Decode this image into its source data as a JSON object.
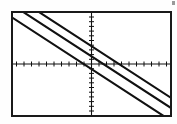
{
  "screen": {
    "title": "Graphing calculator plot window",
    "frame_color": "#1a1a1a",
    "background_color": "#ffffff",
    "ink_color": "#111111"
  },
  "artifact": {
    "name": "scan-artifact",
    "color": "#9a9a9a"
  },
  "chart_data": {
    "type": "line",
    "title": "",
    "subtitle": "",
    "xlabel": "",
    "ylabel": "",
    "grid": false,
    "legend": "none",
    "xlim": [
      -10,
      10
    ],
    "ylim": [
      -10,
      10
    ],
    "x_tick_step": 1,
    "y_tick_step": 1,
    "x_tick_count": 20,
    "y_tick_count": 20,
    "axis_style": "crosshair axes with unit tick marks, no numeric labels",
    "x_axis_y_value": 0,
    "y_axis_x_value": 0,
    "line_style": "solid dotted-pixel (calculator raster)",
    "series": [
      {
        "name": "line-1-upper",
        "slope": -1.0,
        "intercept": 3.5,
        "x": [
          -10,
          10
        ],
        "values": [
          13.5,
          -6.5
        ]
      },
      {
        "name": "line-2-middle",
        "slope": -1.0,
        "intercept": 1.5,
        "x": [
          -10,
          10
        ],
        "values": [
          11.5,
          -8.5
        ]
      },
      {
        "name": "line-3-lower",
        "slope": -1.0,
        "intercept": -1.0,
        "x": [
          -10,
          10
        ],
        "values": [
          9.0,
          -11.0
        ]
      }
    ]
  }
}
